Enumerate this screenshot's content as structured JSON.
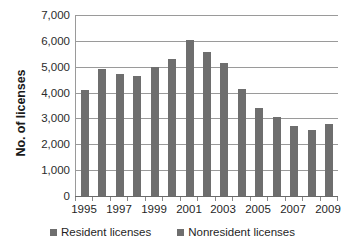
{
  "chart_data": {
    "type": "bar",
    "title": "",
    "subtitle": "",
    "xlabel": "",
    "ylabel": "No. of licenses",
    "ylim": [
      0,
      7000
    ],
    "ytick_values": [
      0,
      1000,
      2000,
      3000,
      4000,
      5000,
      6000,
      7000
    ],
    "ytick_labels": [
      "0",
      "1,000",
      "2,000",
      "3,000",
      "4,000",
      "5,000",
      "6,000",
      "7,000"
    ],
    "grid": true,
    "legend_position": "bottom",
    "categories": [
      "1995",
      "1996",
      "1997",
      "1998",
      "1999",
      "2000",
      "2001",
      "2002",
      "2003",
      "2004",
      "2005",
      "2006",
      "2007",
      "2008",
      "2009"
    ],
    "xtick_labels": [
      "1995",
      "1997",
      "1999",
      "2001",
      "2003",
      "2005",
      "2007",
      "2009"
    ],
    "xtick_categories": [
      "1995",
      "1997",
      "1999",
      "2001",
      "2003",
      "2005",
      "2007",
      "2009"
    ],
    "values": [
      4100,
      4930,
      4720,
      4660,
      4980,
      5280,
      6050,
      5580,
      5140,
      4150,
      3400,
      3040,
      2710,
      2540,
      2790
    ],
    "series": [
      {
        "name": "Resident licenses",
        "color": "#6e6e6e",
        "values": [
          4100,
          4930,
          4720,
          4660,
          4980,
          5280,
          6050,
          5580,
          5140,
          4150,
          3400,
          3040,
          2710,
          2540,
          2790
        ]
      }
    ],
    "bar_color": "#6e6e6e",
    "grid_color": "#9a9a9a",
    "axis_color": "#6a6a6a",
    "background": "#ffffff"
  },
  "legend": {
    "items": [
      {
        "label": "Resident licenses",
        "color": "#6e6e6e"
      },
      {
        "label": "Nonresident licenses",
        "color": "#6e6e6e"
      }
    ]
  }
}
